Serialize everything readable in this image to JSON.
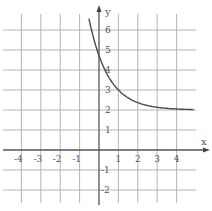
{
  "chart_data": {
    "type": "line",
    "title": "",
    "xlabel": "x",
    "ylabel": "y",
    "xlim": [
      -5,
      5
    ],
    "ylim": [
      -3,
      7
    ],
    "grid": true,
    "x_ticks": [
      -4,
      -3,
      -2,
      -1,
      1,
      2,
      3,
      4
    ],
    "y_ticks": [
      -2,
      -1,
      1,
      2,
      3,
      4,
      5,
      6
    ],
    "x_tick_labels": [
      "-4",
      "-3",
      "-2",
      "-1",
      "1",
      "2",
      "3",
      "4"
    ],
    "y_tick_labels": [
      "-2",
      "-1",
      "1",
      "2",
      "3",
      "4",
      "5",
      "6"
    ],
    "series": [
      {
        "name": "curve",
        "description": "decreasing exponential approaching horizontal asymptote y = 2",
        "x": [
          -0.5,
          -0.25,
          0,
          0.25,
          0.5,
          1,
          1.5,
          2,
          2.5,
          3,
          3.5,
          4,
          4.9
        ],
        "y": [
          6.5,
          5.5,
          4.7,
          4.1,
          3.65,
          3.0,
          2.6,
          2.37,
          2.22,
          2.14,
          2.08,
          2.05,
          2.02
        ]
      }
    ],
    "asymptote": {
      "y": 2
    }
  },
  "axes": {
    "x_label": "x",
    "y_label": "y"
  }
}
